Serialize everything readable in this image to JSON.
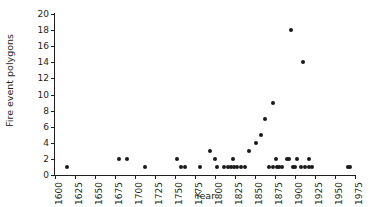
{
  "chart_data": {
    "type": "scatter",
    "title": "",
    "xlabel": "Year",
    "ylabel": "Fire event polygons",
    "xlim": [
      1600,
      1975
    ],
    "ylim": [
      0,
      20
    ],
    "grid": false,
    "legend": null,
    "xticks": [
      1600,
      1625,
      1650,
      1675,
      1700,
      1725,
      1750,
      1775,
      1800,
      1825,
      1850,
      1875,
      1900,
      1925,
      1950,
      1975
    ],
    "xticklabels": [
      "1600",
      "1625",
      "1650",
      "1675",
      "1700",
      "1725",
      "1750",
      "1775",
      "1800",
      "1825",
      "1850",
      "1875",
      "1900",
      "1925",
      "1950",
      "1975"
    ],
    "yticks": [
      0,
      2,
      4,
      6,
      8,
      10,
      12,
      14,
      16,
      18,
      20
    ],
    "yticklabels": [
      "0",
      "2",
      "4",
      "6",
      "8",
      "10",
      "12",
      "14",
      "16",
      "18",
      "20"
    ],
    "marker": "filled-circle",
    "marker_color": "#1a1a1a",
    "points": [
      {
        "x": 1615,
        "y": 1
      },
      {
        "x": 1680,
        "y": 2
      },
      {
        "x": 1690,
        "y": 2
      },
      {
        "x": 1712,
        "y": 1
      },
      {
        "x": 1752,
        "y": 2
      },
      {
        "x": 1758,
        "y": 1
      },
      {
        "x": 1762,
        "y": 1
      },
      {
        "x": 1781,
        "y": 1
      },
      {
        "x": 1794,
        "y": 3
      },
      {
        "x": 1800,
        "y": 2
      },
      {
        "x": 1802,
        "y": 1
      },
      {
        "x": 1811,
        "y": 1
      },
      {
        "x": 1816,
        "y": 1
      },
      {
        "x": 1820,
        "y": 1
      },
      {
        "x": 1822,
        "y": 2
      },
      {
        "x": 1824,
        "y": 1
      },
      {
        "x": 1827,
        "y": 1
      },
      {
        "x": 1832,
        "y": 1
      },
      {
        "x": 1838,
        "y": 1
      },
      {
        "x": 1843,
        "y": 3
      },
      {
        "x": 1851,
        "y": 4
      },
      {
        "x": 1857,
        "y": 5
      },
      {
        "x": 1863,
        "y": 7
      },
      {
        "x": 1872,
        "y": 9
      },
      {
        "x": 1868,
        "y": 1
      },
      {
        "x": 1872,
        "y": 1
      },
      {
        "x": 1876,
        "y": 2
      },
      {
        "x": 1878,
        "y": 1
      },
      {
        "x": 1880,
        "y": 1
      },
      {
        "x": 1884,
        "y": 1
      },
      {
        "x": 1890,
        "y": 2
      },
      {
        "x": 1893,
        "y": 2
      },
      {
        "x": 1895,
        "y": 18
      },
      {
        "x": 1897,
        "y": 1
      },
      {
        "x": 1900,
        "y": 1
      },
      {
        "x": 1903,
        "y": 2
      },
      {
        "x": 1908,
        "y": 1
      },
      {
        "x": 1910,
        "y": 14
      },
      {
        "x": 1912,
        "y": 1
      },
      {
        "x": 1917,
        "y": 2
      },
      {
        "x": 1918,
        "y": 1
      },
      {
        "x": 1921,
        "y": 1
      },
      {
        "x": 1966,
        "y": 1
      },
      {
        "x": 1969,
        "y": 1
      }
    ]
  }
}
